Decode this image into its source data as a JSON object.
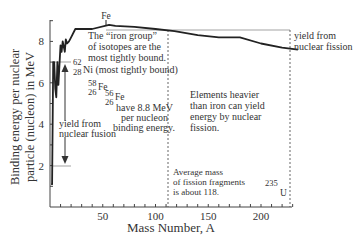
{
  "chart_data": {
    "type": "line",
    "title": "",
    "xlabel": "Mass Number, A",
    "ylabel_line1": "Binding energy per nuclear",
    "ylabel_line2": "particle (nucleon) in MeV",
    "ylabel": "Binding energy per nuclear particle (nucleon) in MeV",
    "xlim": [
      0,
      240
    ],
    "ylim": [
      0,
      9.2
    ],
    "x_ticks": [
      50,
      100,
      150,
      200
    ],
    "x_tick_labels": [
      "50",
      "100",
      "150",
      "200"
    ],
    "y_ticks": [
      2,
      4,
      6,
      8
    ],
    "y_tick_labels": [
      "2",
      "4",
      "6",
      "8"
    ],
    "grid": false,
    "series": [
      {
        "name": "Binding energy per nucleon",
        "x": [
          1,
          2,
          3,
          4,
          5,
          6,
          7,
          8,
          10,
          11,
          12,
          14,
          15,
          16,
          18,
          20,
          24,
          30,
          40,
          56,
          62,
          80,
          100,
          118,
          140,
          160,
          180,
          200,
          220,
          235
        ],
        "y": [
          1.1,
          1.1,
          7.0,
          7.0,
          5.7,
          5.3,
          7.0,
          5.9,
          7.8,
          7.5,
          8.0,
          7.5,
          8.1,
          7.9,
          8.0,
          8.2,
          8.6,
          8.6,
          8.6,
          8.8,
          8.75,
          8.7,
          8.6,
          8.5,
          8.3,
          8.2,
          8.2,
          7.9,
          7.7,
          7.6
        ]
      }
    ],
    "reference_lines": [
      {
        "type": "horizontal",
        "y": 8.5,
        "label": "yield from nuclear fission"
      },
      {
        "type": "horizontal",
        "y": 7.0
      },
      {
        "type": "horizontal",
        "y": 2.0
      },
      {
        "type": "vertical",
        "x": 118,
        "style": "dashed"
      },
      {
        "type": "vertical",
        "x": 235,
        "style": "dashed"
      }
    ],
    "annotations": [
      {
        "text": "Fe",
        "x": 56,
        "y": 8.8
      },
      {
        "text": "The “iron group” of isotopes are the most tightly bound."
      },
      {
        "text": "62 28 Ni (most tightly bound)"
      },
      {
        "text": "58 26 Fe"
      },
      {
        "text": "56 26 Fe have 8.8 MeV per nucleon binding energy."
      },
      {
        "text": "yield from nuclear fusion"
      },
      {
        "text": "Elements heavier than iron can yield energy by nuclear fission."
      },
      {
        "text": "Average mass of fission fragments is about 118."
      },
      {
        "text": "235 U",
        "x": 235
      },
      {
        "text": "yield from nuclear fission"
      }
    ]
  },
  "labels": {
    "fe_peak": "Fe",
    "iron_group": [
      "The “iron group”",
      "of isotopes are the",
      "most tightly bound."
    ],
    "ni62_mass": "62",
    "ni62_z": "28",
    "ni62_text": "Ni (most tightly bound)",
    "fe58_mass": "58",
    "fe58_z": "26",
    "fe58_sym": "Fe",
    "fe56_mass": "56",
    "fe56_z": "26",
    "fe56_sym": "Fe",
    "fe56_text": [
      "have 8.8 MeV",
      "per nucleon",
      "binding energy."
    ],
    "fusion_yield": [
      "yield from",
      "nuclear fusion"
    ],
    "heavier": [
      "Elements heavier",
      "than iron can yield",
      "energy by nuclear",
      "fission."
    ],
    "avg_mass": [
      "Average mass",
      "of fission fragments",
      "is about 118."
    ],
    "u235_mass": "235",
    "u235_sym": "U",
    "fission_yield": [
      "yield from",
      "nuclear fission"
    ]
  }
}
